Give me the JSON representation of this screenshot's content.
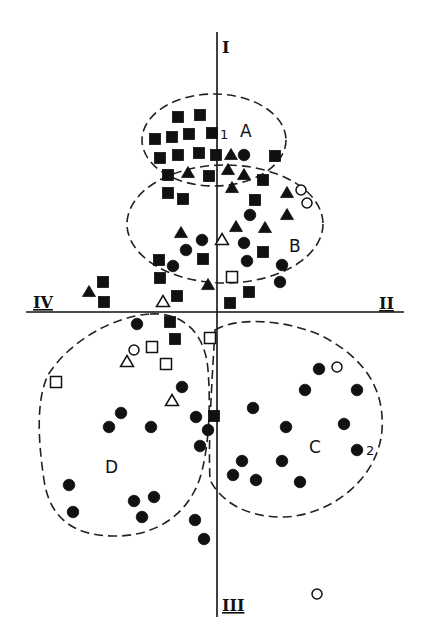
{
  "axes": {
    "top_label": "I",
    "right_label": "II",
    "bottom_label": "III",
    "left_label": "IV"
  },
  "clusters": [
    {
      "id": "A",
      "label": "A"
    },
    {
      "id": "B",
      "label": "B"
    },
    {
      "id": "C",
      "label": "C"
    },
    {
      "id": "D",
      "label": "D"
    }
  ],
  "annotations": [
    {
      "id": "n1",
      "text": "1"
    },
    {
      "id": "n2",
      "text": "2"
    }
  ],
  "marker_types": [
    "filled-square",
    "filled-triangle",
    "filled-circle",
    "open-square",
    "open-triangle",
    "open-circle"
  ],
  "colors": {
    "ink": "#111111",
    "background": "#ffffff"
  },
  "points": [
    [
      "filled-square",
      178,
      117
    ],
    [
      "filled-square",
      200,
      115
    ],
    [
      "filled-square",
      155,
      139
    ],
    [
      "filled-square",
      172,
      137
    ],
    [
      "filled-square",
      189,
      134
    ],
    [
      "filled-square",
      212,
      133
    ],
    [
      "filled-square",
      160,
      158
    ],
    [
      "filled-square",
      178,
      155
    ],
    [
      "filled-square",
      199,
      153
    ],
    [
      "filled-square",
      216,
      155
    ],
    [
      "filled-triangle",
      231,
      155
    ],
    [
      "filled-circle",
      244,
      155
    ],
    [
      "filled-square",
      275,
      156
    ],
    [
      "filled-square",
      168,
      175
    ],
    [
      "filled-triangle",
      188,
      173
    ],
    [
      "filled-square",
      209,
      176
    ],
    [
      "filled-triangle",
      228,
      170
    ],
    [
      "filled-triangle",
      244,
      175
    ],
    [
      "filled-square",
      263,
      180
    ],
    [
      "filled-triangle",
      232,
      188
    ],
    [
      "filled-square",
      168,
      193
    ],
    [
      "filled-square",
      183,
      199
    ],
    [
      "filled-square",
      255,
      200
    ],
    [
      "filled-triangle",
      287,
      193
    ],
    [
      "open-circle",
      301,
      190
    ],
    [
      "open-circle",
      307,
      203
    ],
    [
      "filled-circle",
      250,
      215
    ],
    [
      "filled-triangle",
      287,
      215
    ],
    [
      "filled-triangle",
      236,
      227
    ],
    [
      "filled-triangle",
      265,
      228
    ],
    [
      "filled-triangle",
      181,
      233
    ],
    [
      "filled-circle",
      202,
      240
    ],
    [
      "open-triangle",
      222,
      240
    ],
    [
      "filled-circle",
      244,
      243
    ],
    [
      "filled-circle",
      186,
      250
    ],
    [
      "filled-square",
      263,
      252
    ],
    [
      "filled-square",
      159,
      260
    ],
    [
      "filled-circle",
      173,
      266
    ],
    [
      "filled-square",
      203,
      259
    ],
    [
      "filled-circle",
      247,
      261
    ],
    [
      "filled-circle",
      282,
      265
    ],
    [
      "filled-square",
      160,
      278
    ],
    [
      "open-square",
      232,
      277
    ],
    [
      "filled-circle",
      280,
      282
    ],
    [
      "filled-triangle",
      208,
      285
    ],
    [
      "filled-square",
      103,
      282
    ],
    [
      "filled-triangle",
      89,
      292
    ],
    [
      "filled-square",
      104,
      302
    ],
    [
      "open-triangle",
      163,
      302
    ],
    [
      "filled-square",
      177,
      296
    ],
    [
      "filled-square",
      230,
      303
    ],
    [
      "filled-square",
      249,
      292
    ],
    [
      "filled-circle",
      137,
      324
    ],
    [
      "filled-square",
      170,
      322
    ],
    [
      "filled-square",
      175,
      339
    ],
    [
      "open-square",
      210,
      338
    ],
    [
      "open-circle",
      134,
      350
    ],
    [
      "open-square",
      152,
      347
    ],
    [
      "open-triangle",
      127,
      362
    ],
    [
      "open-square",
      166,
      364
    ],
    [
      "open-square",
      56,
      382
    ],
    [
      "filled-circle",
      182,
      387
    ],
    [
      "open-triangle",
      172,
      401
    ],
    [
      "filled-circle",
      121,
      413
    ],
    [
      "filled-circle",
      109,
      427
    ],
    [
      "filled-circle",
      151,
      427
    ],
    [
      "filled-circle",
      196,
      417
    ],
    [
      "filled-square",
      214,
      416
    ],
    [
      "filled-circle",
      208,
      430
    ],
    [
      "filled-circle",
      200,
      446
    ],
    [
      "filled-circle",
      69,
      485
    ],
    [
      "filled-circle",
      73,
      512
    ],
    [
      "filled-circle",
      134,
      501
    ],
    [
      "filled-circle",
      154,
      497
    ],
    [
      "filled-circle",
      142,
      517
    ],
    [
      "filled-circle",
      195,
      520
    ],
    [
      "filled-circle",
      204,
      539
    ],
    [
      "filled-circle",
      319,
      369
    ],
    [
      "open-circle",
      337,
      367
    ],
    [
      "filled-circle",
      305,
      390
    ],
    [
      "filled-circle",
      357,
      390
    ],
    [
      "filled-circle",
      253,
      408
    ],
    [
      "filled-circle",
      286,
      427
    ],
    [
      "filled-circle",
      344,
      424
    ],
    [
      "filled-circle",
      357,
      450
    ],
    [
      "filled-circle",
      242,
      461
    ],
    [
      "filled-circle",
      282,
      461
    ],
    [
      "filled-circle",
      233,
      475
    ],
    [
      "filled-circle",
      256,
      480
    ],
    [
      "filled-circle",
      300,
      482
    ],
    [
      "open-circle",
      317,
      594
    ]
  ]
}
